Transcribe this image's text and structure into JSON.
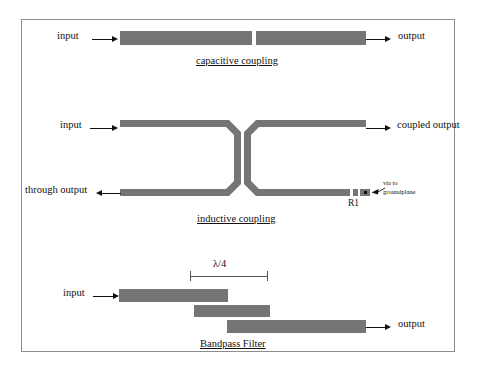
{
  "sections": [
    {
      "id": "capacitive",
      "caption": "capacitive coupling",
      "labels": {
        "input": "input",
        "output": "output"
      }
    },
    {
      "id": "inductive",
      "caption": "inductive coupling",
      "labels": {
        "input": "input",
        "coupled_output": "coupled output",
        "through_output": "through output",
        "resistor": "R1",
        "via_line1": "via to",
        "via_line2": "groundplane"
      }
    },
    {
      "id": "bandpass",
      "caption": "Bandpass Filter",
      "labels": {
        "input": "input",
        "output": "output",
        "dimension": "λ/4"
      }
    }
  ],
  "colors": {
    "trace": "#757575",
    "frame": "#8d8d8d",
    "ink": "#111111",
    "background": "#ffffff"
  }
}
